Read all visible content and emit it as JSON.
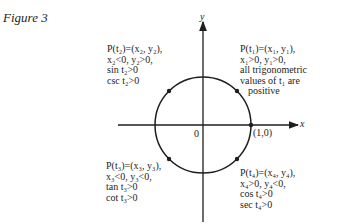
{
  "figure": {
    "title": "Figure 3",
    "axes": {
      "x_label": "x",
      "y_label": "y",
      "origin_label": "0"
    },
    "point_label": "(1,0)",
    "quadrants": {
      "q1": [
        "P(t₁)=(x₁, y₁),",
        "x₁>0, y₁>0,",
        "all trigonometric",
        "values of t₁ are",
        "  positive"
      ],
      "q2": [
        "P(t₂)=(x₂, y₂),",
        "x₂<0, y₂>0,",
        "sin t₂>0",
        "csc t₂>0"
      ],
      "q3": [
        "P(t₃)=(x₃, y₃),",
        "x₃<0, y₃<0,",
        "tan t₃>0",
        "cot t₃>0"
      ],
      "q4": [
        "P(t₄)=(x₄, y₄),",
        "x₄>0, y₄<0,",
        "cos t₄>0",
        "sec t₄>0"
      ]
    },
    "colors": {
      "ink": "#1e1e1e",
      "background": "#ffffff"
    }
  }
}
